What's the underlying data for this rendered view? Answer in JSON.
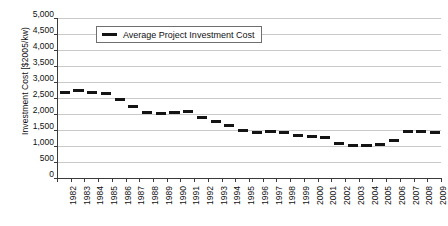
{
  "chart_data": {
    "type": "bar",
    "title": "",
    "subtitle": "",
    "xlabel": "",
    "ylabel": "Investment Cost [$2005/kw)",
    "ylim": [
      0,
      5000
    ],
    "ytick_values": [
      0,
      500,
      1000,
      1500,
      2000,
      2500,
      3000,
      3500,
      4000,
      4500,
      5000
    ],
    "ytick_labels": [
      "0",
      "500",
      "1,000",
      "1,500",
      "2,000",
      "2,500",
      "3,000",
      "3,500",
      "4,000",
      "4,500",
      "5,000"
    ],
    "grid": true,
    "legend_position": "upper-left-inside",
    "legend": [
      "Average Project Investment Cost"
    ],
    "marker_style": "horizontal-dash",
    "categories": [
      "1982",
      "1983",
      "1984",
      "1985",
      "1986",
      "1987",
      "1988",
      "1989",
      "1990",
      "1991",
      "1992",
      "1993",
      "1994",
      "1995",
      "1996",
      "1997",
      "1998",
      "1999",
      "2000",
      "2001",
      "2002",
      "2003",
      "2004",
      "2005",
      "2006",
      "2007",
      "2008",
      "2009"
    ],
    "series": [
      {
        "name": "Average Project Investment Cost",
        "values": [
          2675,
          2730,
          2660,
          2640,
          2450,
          2225,
          2060,
          2010,
          2040,
          2070,
          1900,
          1780,
          1650,
          1480,
          1430,
          1440,
          1420,
          1340,
          1310,
          1255,
          1075,
          1010,
          1005,
          1050,
          1180,
          1445,
          1455,
          1415
        ]
      }
    ]
  },
  "axis": {
    "ylabel": "Investment Cost [$2005/kw)"
  },
  "legend": {
    "label": "Average Project Investment Cost"
  },
  "colors": {
    "series": "#141414",
    "grid": "#c9c9c9",
    "axis": "#3a3a3a",
    "background": "#ffffff"
  }
}
